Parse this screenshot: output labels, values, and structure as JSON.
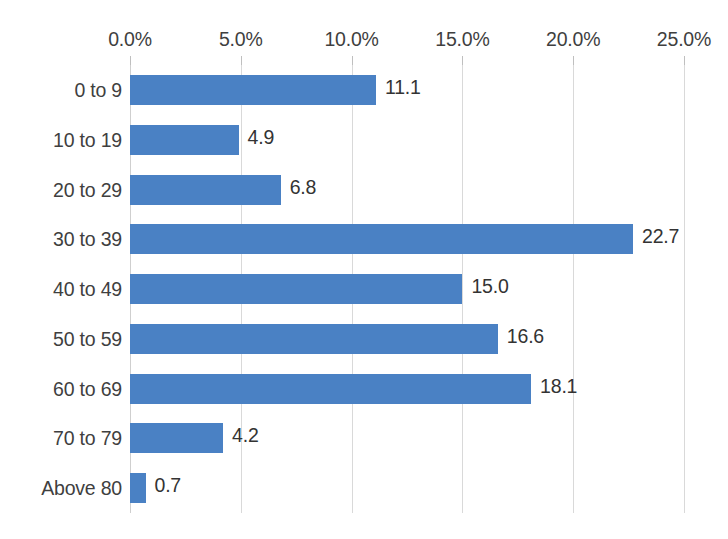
{
  "chart_data": {
    "type": "bar",
    "orientation": "horizontal",
    "title": "",
    "subtitle": "",
    "xlabel": "",
    "ylabel": "",
    "xlim": [
      0,
      25
    ],
    "grid": true,
    "legend": false,
    "legend_position": "none",
    "series_color": "#4a81c4",
    "value_label_suffix": "",
    "x_tick_labels": [
      "0.0%",
      "5.0%",
      "10.0%",
      "15.0%",
      "20.0%",
      "25.0%"
    ],
    "x_tick_values": [
      0,
      5,
      10,
      15,
      20,
      25
    ],
    "categories": [
      "0 to 9",
      "10 to 19",
      "20 to 29",
      "30 to 39",
      "40 to 49",
      "50 to 59",
      "60 to 69",
      "70 to 79",
      "Above 80"
    ],
    "values": [
      11.1,
      4.9,
      6.8,
      22.7,
      15.0,
      16.6,
      18.1,
      4.2,
      0.7
    ],
    "value_labels": [
      "11.1",
      "4.9",
      "6.8",
      "22.7",
      "15.0",
      "16.6",
      "18.1",
      "4.2",
      "0.7"
    ]
  }
}
